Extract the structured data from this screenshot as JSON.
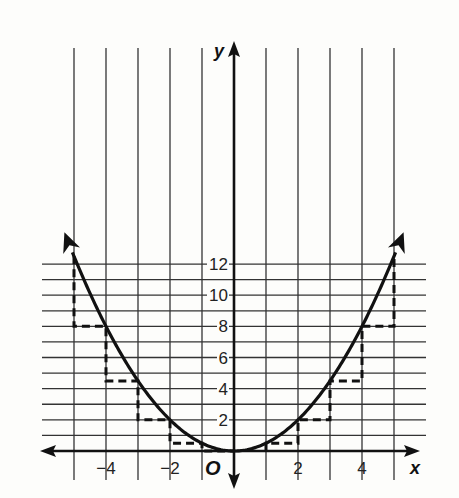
{
  "chart_data": {
    "type": "line",
    "title": "",
    "function": "y = x^2 / 2",
    "xlabel": "x",
    "ylabel": "y",
    "origin_label": "O",
    "xlim": [
      -6,
      6
    ],
    "ylim": [
      0,
      12.9
    ],
    "grid": true,
    "x_ticks": [
      {
        "value": -4,
        "label": "−4"
      },
      {
        "value": -2,
        "label": "−2"
      },
      {
        "value": 2,
        "label": "2"
      },
      {
        "value": 4,
        "label": "4"
      }
    ],
    "y_ticks": [
      {
        "value": 2,
        "label": "2"
      },
      {
        "value": 4,
        "label": "4"
      },
      {
        "value": 6,
        "label": "6"
      },
      {
        "value": 8,
        "label": "8"
      },
      {
        "value": 10,
        "label": "10"
      },
      {
        "value": 12,
        "label": "12"
      }
    ],
    "series": [
      {
        "name": "parabola",
        "style": "solid",
        "x": [
          -5,
          -4,
          -3,
          -2,
          -1,
          0,
          1,
          2,
          3,
          4,
          5
        ],
        "values": [
          12.5,
          8,
          4.5,
          2,
          0.5,
          0,
          0.5,
          2,
          4.5,
          8,
          12.5
        ]
      },
      {
        "name": "step-approximation",
        "style": "dashed",
        "points": [
          [
            -5,
            12.5
          ],
          [
            -5,
            8
          ],
          [
            -4,
            8
          ],
          [
            -4,
            4.5
          ],
          [
            -3,
            4.5
          ],
          [
            -3,
            2
          ],
          [
            -2,
            2
          ],
          [
            -2,
            0.5
          ],
          [
            -1,
            0.5
          ],
          [
            -1,
            0
          ],
          [
            0,
            0
          ],
          [
            1,
            0
          ],
          [
            1,
            0.5
          ],
          [
            2,
            0.5
          ],
          [
            2,
            2
          ],
          [
            3,
            2
          ],
          [
            3,
            4.5
          ],
          [
            4,
            4.5
          ],
          [
            4,
            8
          ],
          [
            5,
            8
          ],
          [
            5,
            12.5
          ]
        ]
      }
    ],
    "colors": {
      "line": "#111111",
      "grid": "#333333",
      "background": "#fdfdfb"
    }
  }
}
